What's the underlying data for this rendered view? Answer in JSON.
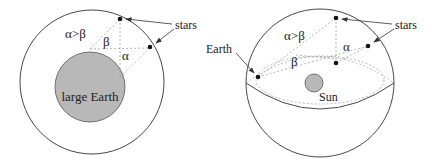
{
  "left_diagram": {
    "inequality_label": "α>β",
    "beta_label": "β",
    "alpha_label": "α",
    "earth_label": "large Earth",
    "stars_label": "stars"
  },
  "right_diagram": {
    "earth_label": "Earth",
    "inequality_label": "α>β",
    "beta_label": "β",
    "alpha_label": "α",
    "sun_label": "Sun",
    "stars_label": "stars"
  },
  "colors": {
    "line": "#333333",
    "dashed": "#999999",
    "earth_fill": "#b8b8b8",
    "sun_fill": "#b8b8b8"
  }
}
